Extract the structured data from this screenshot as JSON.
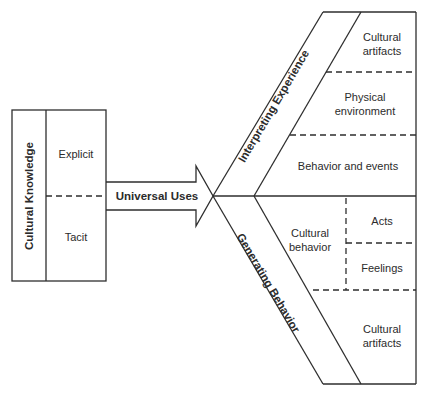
{
  "diagram": {
    "left_box": {
      "title": "Cultural Knowledge",
      "cells": [
        "Explicit",
        "Tacit"
      ]
    },
    "arrow": {
      "label": "Universal Uses"
    },
    "upper_branch": {
      "title": "Interpreting Experience",
      "cells": [
        {
          "line1": "Cultural",
          "line2": "artifacts"
        },
        {
          "line1": "Physical",
          "line2": "environment"
        },
        {
          "line1": "Behavior and events",
          "line2": ""
        }
      ]
    },
    "lower_branch": {
      "title": "Generating Behavior",
      "cultural_behavior": {
        "line1": "Cultural",
        "line2": "behavior"
      },
      "sub_cells": [
        "Acts",
        "Feelings"
      ],
      "bottom_cell": {
        "line1": "Cultural",
        "line2": "artifacts"
      }
    },
    "colors": {
      "line": "#2e2e2e",
      "text": "#2b2b2b",
      "background": "#ffffff"
    }
  }
}
